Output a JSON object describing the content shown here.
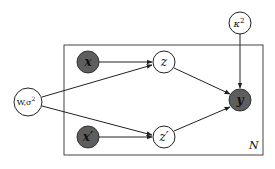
{
  "diagram": {
    "type": "plate-notation-graphical-model",
    "plate": {
      "label": "N"
    },
    "nodes": {
      "x": {
        "label": "x",
        "observed": true
      },
      "x_prime": {
        "label": "x′",
        "observed": true
      },
      "z": {
        "label": "z",
        "observed": false
      },
      "z_prime": {
        "label": "z′",
        "observed": false
      },
      "y": {
        "label": "y",
        "observed": true
      },
      "w_sigma": {
        "label_main": "W,σ",
        "label_sup": "2",
        "observed": false
      },
      "kappa": {
        "label_main": "κ",
        "label_sup": "2",
        "observed": false
      }
    },
    "edges": [
      {
        "from": "x",
        "to": "z"
      },
      {
        "from": "x_prime",
        "to": "z_prime"
      },
      {
        "from": "w_sigma",
        "to": "z"
      },
      {
        "from": "w_sigma",
        "to": "z_prime"
      },
      {
        "from": "z",
        "to": "y"
      },
      {
        "from": "z_prime",
        "to": "y"
      },
      {
        "from": "kappa",
        "to": "y"
      }
    ],
    "colors": {
      "observed_fill": "#5e5e5e",
      "latent_fill": "#ffffff",
      "stroke": "#222222"
    }
  }
}
